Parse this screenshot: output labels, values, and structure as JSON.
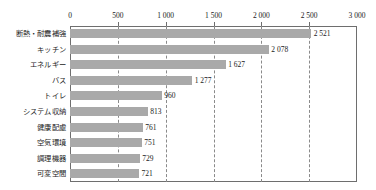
{
  "chart_data": {
    "type": "bar",
    "orientation": "horizontal",
    "title": "",
    "xlabel": "",
    "ylabel": "",
    "xlim": [
      0,
      3000
    ],
    "grid": true,
    "legend": "none",
    "categories": [
      "断熱・耐震補強",
      "キッチン",
      "エネルギー",
      "バス",
      "トイレ",
      "システム収納",
      "健康配慮",
      "空気環境",
      "調理機器",
      "可変空間"
    ],
    "values": [
      2521,
      2078,
      1627,
      1277,
      960,
      813,
      761,
      751,
      729,
      721
    ],
    "value_labels": [
      "2 521",
      "2 078",
      "1 627",
      "1 277",
      "960",
      "813",
      "761",
      "751",
      "729",
      "721"
    ],
    "xticks": [
      0,
      500,
      1000,
      1500,
      2000,
      2500,
      3000
    ],
    "xtick_labels": [
      "0",
      "500",
      "1 000",
      "1 500",
      "2 000",
      "2 500",
      "3 000"
    ],
    "bar_color": "#a9a9a9",
    "axis_color": "#6e6e6e",
    "gridline_color": "#8a8a8a"
  }
}
